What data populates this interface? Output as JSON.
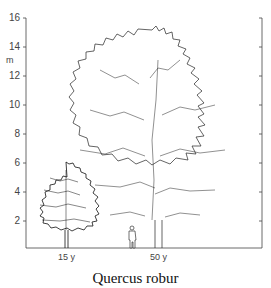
{
  "diagram": {
    "y_axis": {
      "unit": "m",
      "ticks": [
        "2",
        "4",
        "6",
        "8",
        "10",
        "12",
        "14",
        "16"
      ]
    },
    "trees": [
      {
        "label": "15 y"
      },
      {
        "label": "50 y"
      }
    ],
    "caption": "Quercus robur"
  },
  "colors": {
    "line": "#333333",
    "background": "#ffffff"
  }
}
